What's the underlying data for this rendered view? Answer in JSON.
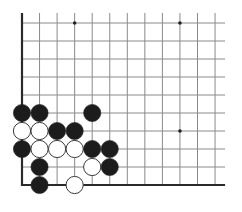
{
  "diagram": {
    "type": "go-board-fragment",
    "grid": {
      "columns": 12,
      "rows": 10,
      "origin_x": 22,
      "origin_y": 23,
      "step_x": 17.55,
      "step_y": 18,
      "line_extend_top": 10,
      "line_extend_right": 10,
      "line_color": "#8a8a8a",
      "edge_color": "#2a2a2a",
      "background": "#ffffff"
    },
    "edges": [
      "left",
      "bottom"
    ],
    "star_points": [
      {
        "col": 3,
        "row": 0
      },
      {
        "col": 9,
        "row": 0
      },
      {
        "col": 9,
        "row": 6
      }
    ],
    "stone_radius": 8.6,
    "colors": {
      "black": "#1c1c1c",
      "white_fill": "#ffffff",
      "white_stroke": "#3a3a3a"
    },
    "stones": [
      {
        "color": "black",
        "col": 0,
        "row": 5
      },
      {
        "color": "black",
        "col": 1,
        "row": 5
      },
      {
        "color": "black",
        "col": 4,
        "row": 5
      },
      {
        "color": "white",
        "col": 0,
        "row": 6
      },
      {
        "color": "white",
        "col": 1,
        "row": 6
      },
      {
        "color": "black",
        "col": 2,
        "row": 6
      },
      {
        "color": "black",
        "col": 3,
        "row": 6
      },
      {
        "color": "black",
        "col": 0,
        "row": 7
      },
      {
        "color": "white",
        "col": 1,
        "row": 7
      },
      {
        "color": "white",
        "col": 2,
        "row": 7
      },
      {
        "color": "white",
        "col": 3,
        "row": 7
      },
      {
        "color": "black",
        "col": 4,
        "row": 7
      },
      {
        "color": "black",
        "col": 5,
        "row": 7
      },
      {
        "color": "black",
        "col": 1,
        "row": 8
      },
      {
        "color": "white",
        "col": 4,
        "row": 8
      },
      {
        "color": "black",
        "col": 5,
        "row": 8
      },
      {
        "color": "black",
        "col": 1,
        "row": 9
      },
      {
        "color": "white",
        "col": 3,
        "row": 9
      }
    ]
  }
}
